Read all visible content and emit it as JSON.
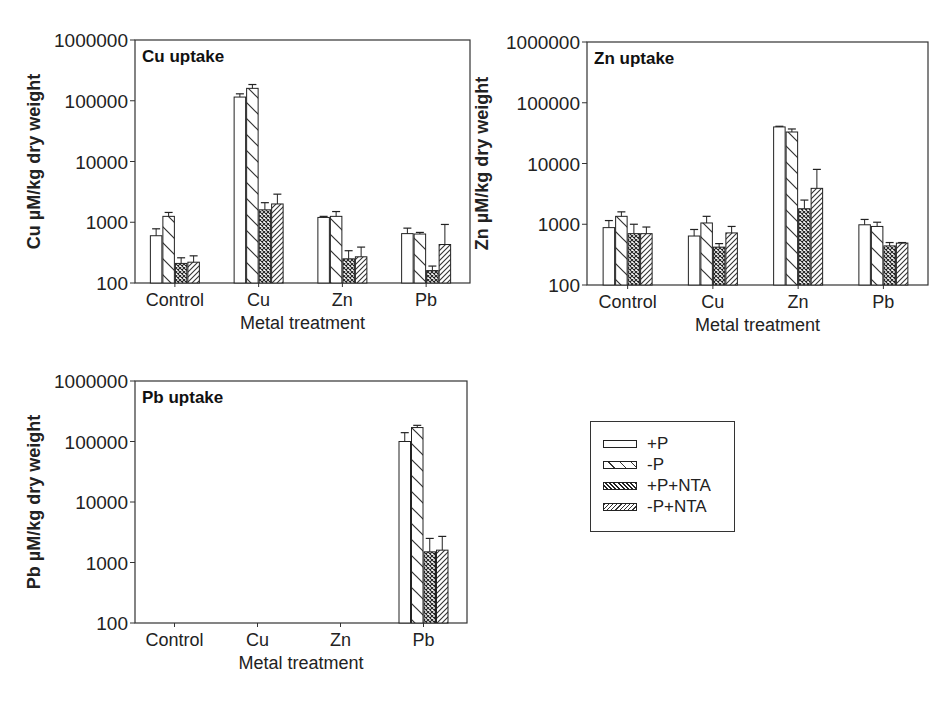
{
  "chart_data": [
    {
      "type": "bar",
      "title": "Cu uptake",
      "xlabel": "Metal treatment",
      "ylabel": "Cu µM/kg dry weight",
      "yscale": "log",
      "ylim": [
        100,
        1000000
      ],
      "yticks": [
        "1000000",
        "100000",
        "10000",
        "1000",
        "100"
      ],
      "categories": [
        "Control",
        "Cu",
        "Zn",
        "Pb"
      ],
      "series": [
        {
          "name": "+P",
          "values": [
            600,
            115000,
            1200,
            650
          ],
          "errors": [
            780,
            130000,
            1250,
            800
          ]
        },
        {
          "name": "-P",
          "values": [
            1250,
            160000,
            1250,
            640
          ],
          "errors": [
            1450,
            185000,
            1500,
            680
          ]
        },
        {
          "name": "+P+NTA",
          "values": [
            210,
            1600,
            250,
            160
          ],
          "errors": [
            260,
            2100,
            340,
            190
          ]
        },
        {
          "name": "-P+NTA",
          "values": [
            220,
            2000,
            270,
            430
          ],
          "errors": [
            280,
            2900,
            390,
            920
          ]
        }
      ],
      "grid": false,
      "legend_position": "separate panel, lower right"
    },
    {
      "type": "bar",
      "title": "Zn uptake",
      "xlabel": "Metal treatment",
      "ylabel": "Zn µM/kg dry weight",
      "yscale": "log",
      "ylim": [
        100,
        1000000
      ],
      "yticks": [
        "1000000",
        "100000",
        "10000",
        "1000",
        "100"
      ],
      "categories": [
        "Control",
        "Cu",
        "Zn",
        "Pb"
      ],
      "series": [
        {
          "name": "+P",
          "values": [
            880,
            640,
            40000,
            980
          ],
          "errors": [
            1150,
            820,
            41000,
            1200
          ]
        },
        {
          "name": "-P",
          "values": [
            1350,
            1050,
            33000,
            920
          ],
          "errors": [
            1600,
            1350,
            37000,
            1080
          ]
        },
        {
          "name": "+P+NTA",
          "values": [
            700,
            420,
            1800,
            440
          ],
          "errors": [
            1000,
            480,
            2500,
            500
          ]
        },
        {
          "name": "-P+NTA",
          "values": [
            700,
            720,
            3900,
            490
          ],
          "errors": [
            900,
            920,
            8000,
            500
          ]
        }
      ],
      "grid": false,
      "legend_position": "separate panel, lower right"
    },
    {
      "type": "bar",
      "title": "Pb uptake",
      "xlabel": "Metal treatment",
      "ylabel": "Pb µM/kg dry weight",
      "yscale": "log",
      "ylim": [
        100,
        1000000
      ],
      "yticks": [
        "1000000",
        "100000",
        "10000",
        "1000",
        "100"
      ],
      "categories": [
        "Control",
        "Cu",
        "Zn",
        "Pb"
      ],
      "series": [
        {
          "name": "+P",
          "values": [
            null,
            null,
            null,
            100000
          ],
          "errors": [
            null,
            null,
            null,
            140000
          ]
        },
        {
          "name": "-P",
          "values": [
            null,
            null,
            null,
            170000
          ],
          "errors": [
            null,
            null,
            null,
            185000
          ]
        },
        {
          "name": "+P+NTA",
          "values": [
            null,
            null,
            null,
            1500
          ],
          "errors": [
            null,
            null,
            null,
            2500
          ]
        },
        {
          "name": "-P+NTA",
          "values": [
            null,
            null,
            null,
            1600
          ],
          "errors": [
            null,
            null,
            null,
            2700
          ]
        }
      ],
      "grid": false,
      "legend_position": "separate panel, lower right"
    }
  ],
  "legend": {
    "items": [
      {
        "label": "+P",
        "pattern": "open"
      },
      {
        "label": "-P",
        "pattern": "wide-backslash"
      },
      {
        "label": "+P+NTA",
        "pattern": "crosshatch"
      },
      {
        "label": "-P+NTA",
        "pattern": "dense-slash"
      }
    ]
  }
}
